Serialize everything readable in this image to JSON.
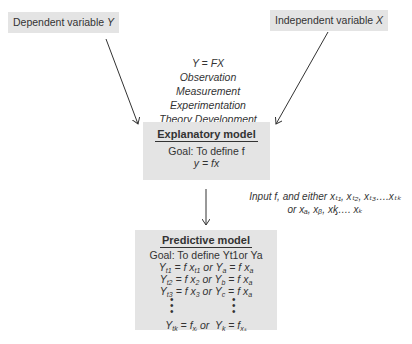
{
  "inputs": {
    "dependent": {
      "label": "Dependent variable",
      "symbol": "Y"
    },
    "independent": {
      "label": "Independent variable",
      "symbol": "X"
    }
  },
  "process": {
    "lines": [
      "Y = FX",
      "Observation",
      "Measurement",
      "Experimentation",
      "Theory Development"
    ]
  },
  "explanatory_model": {
    "title": "Explanatory model",
    "goal": "Goal: To define f",
    "equation": "y = fx"
  },
  "input_note": {
    "line1": "Input f, and either xₜ₁, xₜ₂, xₜ₃….xₜₖ",
    "line2": "or xₐ, xᵦ, xᶄ…. xₖ"
  },
  "predictive_model": {
    "title": "Predictive model",
    "goal": "Goal: To define Yt1or Ya",
    "rows": [
      {
        "left_y": "Y",
        "left_ysub": "t1",
        "left_x": "= f x",
        "left_xsub": "t1",
        "right_y": "Y",
        "right_ysub": "a",
        "right_x": "= f x",
        "right_xsub": "a"
      },
      {
        "left_y": "Y",
        "left_ysub": "t2",
        "left_x": "= f x",
        "left_xsub": "2",
        "right_y": "Y",
        "right_ysub": "b",
        "right_x": "= f x",
        "right_xsub": "a"
      },
      {
        "left_y": "Y",
        "left_ysub": "t3",
        "left_x": "= f x",
        "left_xsub": "3",
        "right_y": "Y",
        "right_ysub": "c",
        "right_x": "= f x",
        "right_xsub": "a"
      }
    ],
    "connector": "or",
    "last_row": {
      "left_y": "Y",
      "left_ysub": "tk",
      "left_x": "= f",
      "left_xsub": "xᵢ",
      "right_y": "Y",
      "right_ysub": "k",
      "right_x": "= f",
      "right_xsub": "xₖ"
    }
  },
  "colors": {
    "box_fill": "#e4e4e4",
    "line": "#333333"
  }
}
